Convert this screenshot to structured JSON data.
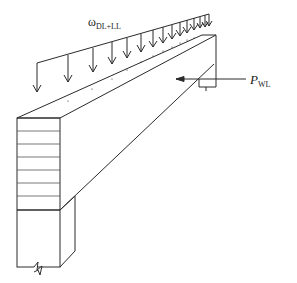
{
  "diagram": {
    "labels": {
      "distributed_load": {
        "main": "ω",
        "sub": "DL+LL"
      },
      "wind_load": {
        "main": "P",
        "sub": "WL"
      }
    },
    "colors": {
      "line": "#2a2a2a",
      "hatch": "#555555",
      "background": "#ffffff"
    }
  }
}
